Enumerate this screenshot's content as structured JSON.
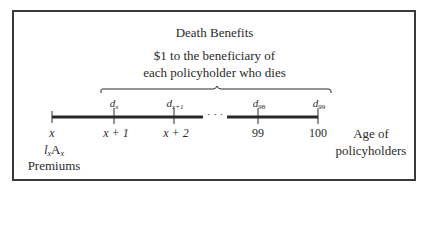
{
  "diagram": {
    "title": "Death Benefits",
    "subtitle_line1": "$1 to the beneficiary of",
    "subtitle_line2": "each policyholder who dies",
    "timeline": {
      "ticks": [
        {
          "label": "x",
          "x": 52
        },
        {
          "label": "x + 1",
          "x": 114,
          "death_label": "d",
          "death_sub": "x"
        },
        {
          "label": "x + 2",
          "x": 174,
          "death_label": "d",
          "death_sub": "x+1"
        },
        {
          "label": "99",
          "x": 258,
          "death_label": "d",
          "death_sub": "98"
        },
        {
          "label": "100",
          "x": 318,
          "death_label": "d",
          "death_sub": "99"
        }
      ],
      "ellipsis": "· · ·",
      "axis_label_line1": "Age of",
      "axis_label_line2": "policyholders"
    },
    "premium": {
      "symbol_l": "l",
      "symbol_l_sub": "x",
      "symbol_A": "A",
      "symbol_A_sub": "x",
      "label": "Premiums"
    },
    "colors": {
      "line": "#2a2a2a",
      "frame": "#3a3a3a",
      "text": "#2a2a2a"
    }
  }
}
